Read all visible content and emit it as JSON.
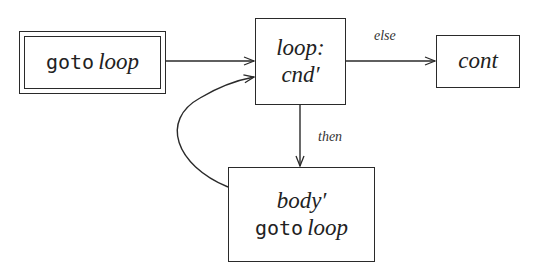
{
  "diagram": {
    "type": "control-flow-graph",
    "stroke_color": "#2a2a2a",
    "nodes": {
      "entry": {
        "style": "double-border",
        "keyword": "goto",
        "label": "loop"
      },
      "loop": {
        "label_line1": "loop:",
        "label_line2": "cnd′"
      },
      "cont": {
        "label": "cont"
      },
      "body": {
        "label_line1": "body′",
        "keyword": "goto",
        "label": "loop"
      }
    },
    "edges": [
      {
        "from": "entry",
        "to": "loop",
        "label": ""
      },
      {
        "from": "loop",
        "to": "cont",
        "label": "else"
      },
      {
        "from": "loop",
        "to": "body",
        "label": "then"
      },
      {
        "from": "body",
        "to": "loop",
        "label": ""
      }
    ],
    "edge_labels": {
      "else": "else",
      "then": "then"
    }
  }
}
